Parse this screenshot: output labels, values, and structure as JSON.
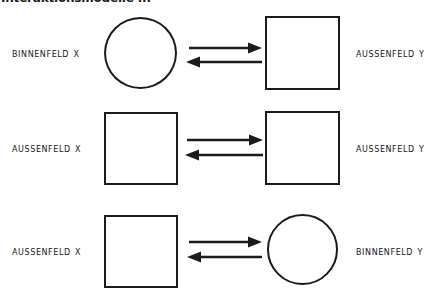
{
  "document": {
    "title_truncated": "Interaktionsmodelle ...",
    "ink_color": "#1b1b1b",
    "background_color": "#ffffff"
  },
  "diagram": {
    "type": "relationship-diagram",
    "row_count": 3,
    "rows": [
      {
        "id": "row-1",
        "left": {
          "label": "Binnenfeld X",
          "shape": "circle"
        },
        "right": {
          "label": "Aussenfeld Y",
          "shape": "square"
        },
        "connector": {
          "kind": "bidirectional-arrow-pair",
          "top_arrow_direction": "right",
          "bottom_arrow_direction": "left"
        }
      },
      {
        "id": "row-2",
        "left": {
          "label": "Aussenfeld X",
          "shape": "square"
        },
        "right": {
          "label": "Aussenfeld Y",
          "shape": "square"
        },
        "connector": {
          "kind": "bidirectional-arrow-pair",
          "top_arrow_direction": "right",
          "bottom_arrow_direction": "left"
        }
      },
      {
        "id": "row-3",
        "left": {
          "label": "Aussenfeld X",
          "shape": "square"
        },
        "right": {
          "label": "Binnenfeld Y",
          "shape": "circle"
        },
        "connector": {
          "kind": "bidirectional-arrow-pair",
          "top_arrow_direction": "right",
          "bottom_arrow_direction": "left"
        }
      }
    ]
  }
}
